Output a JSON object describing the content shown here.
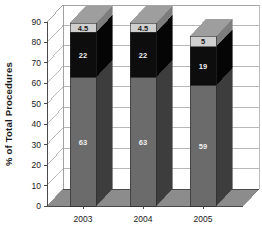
{
  "chart_data": {
    "type": "bar",
    "subtype": "stacked-3d-column",
    "title": "",
    "xlabel": "",
    "ylabel": "% of Total Procedures",
    "categories": [
      "2003",
      "2004",
      "2005"
    ],
    "ylim": [
      0,
      90
    ],
    "yticks": [
      0,
      10,
      20,
      30,
      40,
      50,
      60,
      70,
      80,
      90
    ],
    "ytick_labels": [
      "0",
      "10",
      "20",
      "30",
      "40",
      "50",
      "60",
      "70",
      "80",
      "90"
    ],
    "grid": true,
    "legend": "none",
    "series": [
      {
        "name": "bottom",
        "values": [
          63,
          63,
          59
        ],
        "labels": [
          "63",
          "63",
          "59"
        ],
        "color": "#6b6b6b"
      },
      {
        "name": "middle",
        "values": [
          22,
          22,
          19
        ],
        "labels": [
          "22",
          "22",
          "19"
        ],
        "color": "#0d0d0d"
      },
      {
        "name": "top",
        "values": [
          4.5,
          4.5,
          5
        ],
        "labels": [
          "4.5",
          "4.5",
          "5"
        ],
        "color": "#cfcfcf"
      }
    ],
    "totals": [
      89.5,
      89.5,
      83
    ]
  },
  "colors": {
    "bottom_front": "#6b6b6b",
    "bottom_side": "#3d3d3d",
    "bottom_top": "#8a8a8a",
    "middle_front": "#0d0d0d",
    "middle_side": "#050505",
    "middle_top": "#565656",
    "top_front": "#cfcfcf",
    "top_side": "#7d7d7d",
    "top_top": "#9e9e9e",
    "floor": "#8c8c8c",
    "floor_edge": "#6f6f6f",
    "wall": "#ffffff",
    "gridline": "#9a9a9a",
    "axis": "#4a4a4a"
  }
}
